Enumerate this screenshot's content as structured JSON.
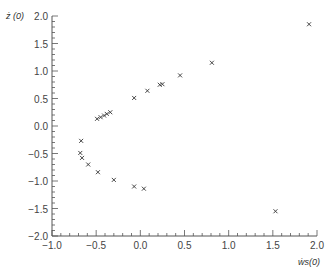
{
  "chart_data": {
    "type": "scatter",
    "title": "",
    "xlabel": "ẇ_s(0)",
    "ylabel": "ż (0)",
    "xlim": [
      -1.0,
      2.0
    ],
    "ylim": [
      -2.0,
      2.0
    ],
    "x_ticks": [
      "-1.0",
      "-0.5",
      "0.0",
      "0.5",
      "1.0",
      "1.5",
      "2.0"
    ],
    "y_ticks": [
      "2.0",
      "1.5",
      "1.0",
      "0.5",
      "0.0",
      "-0.5",
      "-1.0",
      "-1.5",
      "-2.0"
    ],
    "marker": "x",
    "grid": false,
    "legend": null,
    "series": [
      {
        "name": "points",
        "x": [
          1.91,
          1.53,
          0.81,
          0.45,
          0.25,
          0.22,
          0.08,
          -0.07,
          -0.49,
          -0.45,
          -0.41,
          -0.38,
          -0.34,
          -0.67,
          -0.68,
          -0.66,
          -0.59,
          -0.48,
          -0.3,
          -0.07,
          0.04
        ],
        "y": [
          1.85,
          -1.55,
          1.15,
          0.92,
          0.76,
          0.75,
          0.64,
          0.51,
          0.13,
          0.16,
          0.19,
          0.22,
          0.25,
          -0.27,
          -0.49,
          -0.58,
          -0.7,
          -0.84,
          -0.98,
          -1.1,
          -1.14
        ]
      }
    ]
  },
  "labels": {
    "y_axis_name": "ż (0)",
    "x_axis_name": "ẇs(0)"
  }
}
